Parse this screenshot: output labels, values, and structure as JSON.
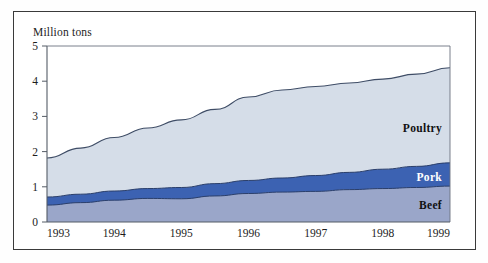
{
  "chart_data": {
    "type": "area",
    "stacked": true,
    "title": "",
    "subtitle": "",
    "xlabel": "",
    "ylabel": "Million tons",
    "ylim": [
      0,
      5
    ],
    "yticks": [
      0,
      1,
      2,
      3,
      4,
      5
    ],
    "ytick_labels": [
      "0",
      "1",
      "2",
      "3",
      "4",
      "5"
    ],
    "xlim": [
      1993,
      1999
    ],
    "xticks": [
      1993,
      1994,
      1995,
      1996,
      1997,
      1998,
      1999
    ],
    "xtick_labels": [
      "1993",
      "1994",
      "1995",
      "1996",
      "1997",
      "1998",
      "1999"
    ],
    "grid": false,
    "legend_position": "inline-right",
    "x": [
      1993,
      1993.5,
      1994,
      1994.5,
      1995,
      1995.5,
      1996,
      1996.5,
      1997,
      1997.5,
      1998,
      1998.5,
      1999
    ],
    "series": [
      {
        "name": "Beef",
        "color": "#9aa6c9",
        "values": [
          0.48,
          0.55,
          0.62,
          0.67,
          0.66,
          0.74,
          0.81,
          0.85,
          0.87,
          0.92,
          0.95,
          0.98,
          1.02
        ]
      },
      {
        "name": "Pork",
        "color": "#3c62b2",
        "values": [
          0.23,
          0.24,
          0.26,
          0.28,
          0.32,
          0.35,
          0.37,
          0.4,
          0.45,
          0.49,
          0.55,
          0.6,
          0.66
        ]
      },
      {
        "name": "Poultry",
        "color": "#d5dde8",
        "values": [
          1.11,
          1.31,
          1.52,
          1.72,
          1.92,
          2.11,
          2.37,
          2.5,
          2.53,
          2.54,
          2.56,
          2.62,
          2.7
        ]
      }
    ],
    "cumulative_totals": [
      1.82,
      2.1,
      2.4,
      2.67,
      2.9,
      3.2,
      3.55,
      3.75,
      3.85,
      3.95,
      4.06,
      4.2,
      4.38
    ],
    "annotations": [
      {
        "label": "Poultry",
        "color": "#111111"
      },
      {
        "label": "Pork",
        "color": "#ffffff"
      },
      {
        "label": "Beef",
        "color": "#111111"
      }
    ]
  },
  "axes": {
    "y_axis_name": "y-axis",
    "x_axis_name": "x-axis"
  }
}
